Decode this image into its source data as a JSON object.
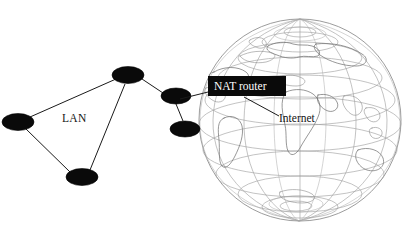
{
  "diagram": {
    "background_color": "#ffffff",
    "node_color": "#0a0a0a",
    "link_color": "#1a1a1a",
    "globe_line_color": "#9a9a9a",
    "labels": {
      "lan": "LAN",
      "nat_router": "NAT router",
      "internet": "Internet"
    },
    "label_styles": {
      "nat_router_box_fill": "#0a0a0a",
      "nat_router_text_fill": "#ffffff",
      "internet_text_fill": "#141414",
      "lan_text_fill": "#141414"
    },
    "nodes": [
      {
        "id": "lan-host-left",
        "label": "",
        "cx": 18,
        "cy": 122,
        "rx": 16,
        "ry": 8.5
      },
      {
        "id": "lan-switch-top",
        "label": "",
        "cx": 128,
        "cy": 75,
        "rx": 16,
        "ry": 8.5
      },
      {
        "id": "lan-host-bottom",
        "label": "",
        "cx": 82,
        "cy": 177,
        "rx": 16,
        "ry": 8.5
      },
      {
        "id": "nat-router-node",
        "label": "",
        "cx": 176,
        "cy": 96,
        "rx": 15,
        "ry": 8.0
      },
      {
        "id": "gateway-node",
        "label": "",
        "cx": 185,
        "cy": 129,
        "rx": 15,
        "ry": 8.0
      }
    ],
    "links": [
      {
        "from": "lan-host-left",
        "to": "lan-switch-top"
      },
      {
        "from": "lan-host-left",
        "to": "lan-host-bottom"
      },
      {
        "from": "lan-host-bottom",
        "to": "lan-switch-top"
      },
      {
        "from": "lan-switch-top",
        "to": "nat-router-node"
      },
      {
        "from": "nat-router-node",
        "to": "gateway-node"
      }
    ],
    "globe": {
      "center_x": 300,
      "center_y": 120,
      "radius": 101,
      "meridian_count": 12,
      "parallel_count": 7,
      "description": "wireframe earth globe with latitude and longitude graticule and faint continent outlines"
    },
    "callouts": [
      {
        "id": "nat-router-callout",
        "text": "NAT router",
        "box": {
          "x": 208,
          "y": 76,
          "width": 78,
          "height": 20
        },
        "leader_from": {
          "x": 208,
          "y": 92
        },
        "leader_to": {
          "x": 180,
          "y": 99
        }
      },
      {
        "id": "internet-callout",
        "text": "Internet",
        "text_position": {
          "x": 258,
          "y": 122
        },
        "leader_from": {
          "x": 244,
          "y": 97
        },
        "leader_to": {
          "x": 278,
          "y": 116
        }
      }
    ],
    "lan_label_position": {
      "x": 62,
      "y": 122
    }
  }
}
